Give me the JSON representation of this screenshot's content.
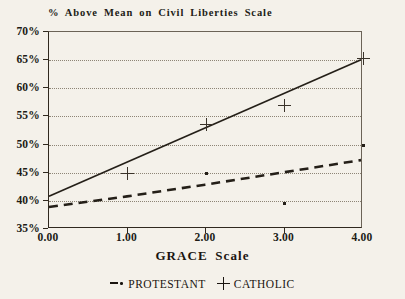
{
  "chart_data": {
    "type": "line",
    "title": "% Above Mean on Civil Liberties Scale",
    "xlabel": "GRACE Scale",
    "ylabel": "",
    "xlim": [
      0,
      4
    ],
    "ylim": [
      35,
      70
    ],
    "grid": "horizontal-dotted",
    "legend_position": "bottom",
    "x": [
      0,
      1,
      2,
      3,
      4
    ],
    "xticklabels": [
      "0.00",
      "1.00",
      "2.00",
      "3.00",
      "4.00"
    ],
    "yticks": [
      35,
      40,
      45,
      50,
      55,
      60,
      65,
      70
    ],
    "yticklabels": [
      "35%",
      "40%",
      "45%",
      "50%",
      "55%",
      "60%",
      "65%",
      "70%"
    ],
    "series": [
      {
        "name": "CATHOLIC",
        "marker": "plus",
        "line_style": "solid",
        "fit_line": [
          {
            "x": 0,
            "y": 40.5
          },
          {
            "x": 4,
            "y": 65.0
          }
        ],
        "points": [
          {
            "x": 1,
            "y": 44.8
          },
          {
            "x": 2,
            "y": 53.5
          },
          {
            "x": 3,
            "y": 57.0
          },
          {
            "x": 4,
            "y": 65.3
          }
        ]
      },
      {
        "name": "PROTESTANT",
        "marker": "dot",
        "line_style": "dashed",
        "fit_line": [
          {
            "x": 0,
            "y": 38.6
          },
          {
            "x": 1,
            "y": 40.5
          },
          {
            "x": 2,
            "y": 42.6
          },
          {
            "x": 3,
            "y": 44.8
          },
          {
            "x": 4,
            "y": 47.0
          }
        ],
        "points": [
          {
            "x": 2,
            "y": 44.8
          },
          {
            "x": 3,
            "y": 39.5
          },
          {
            "x": 4,
            "y": 49.8
          }
        ]
      }
    ]
  },
  "legend": {
    "protestant_label": "PROTESTANT",
    "catholic_label": "CATHOLIC",
    "protestant_marker": "dash-dot-marker-icon",
    "catholic_marker": "plus-marker-icon"
  },
  "colors": {
    "background": "#f4f1ea",
    "ink": "#1a1510",
    "grid": "#8d8576",
    "axis": "#30291f"
  }
}
